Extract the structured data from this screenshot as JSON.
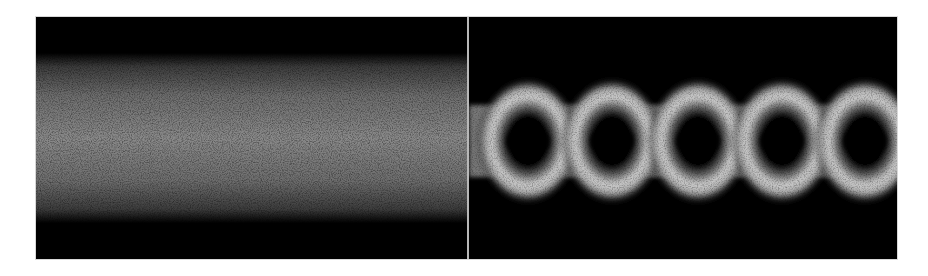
{
  "figure": {
    "panels": [
      {
        "id": "left",
        "description": "Uniform noisy horizontal gray band on black background",
        "band": {
          "top_px": 36,
          "height_px": 170,
          "peak_gray": "#8a8a8a"
        }
      },
      {
        "id": "right",
        "description": "Horizontal chain of five bright ring-shaped lobes with dark cores on black background",
        "ring_count": 5,
        "ring_centers_x": [
          59,
          143,
          229,
          313,
          396
        ],
        "ring_center_y": 124,
        "core_rx": 23,
        "core_ry": 16,
        "ring_rx": 48,
        "ring_ry": 58,
        "ring_color": "#d0d0d0"
      }
    ],
    "colors": {
      "background": "#000000",
      "divider": "#b8b8b8",
      "frame_border": "#d8d8d8",
      "page": "#ffffff"
    }
  }
}
